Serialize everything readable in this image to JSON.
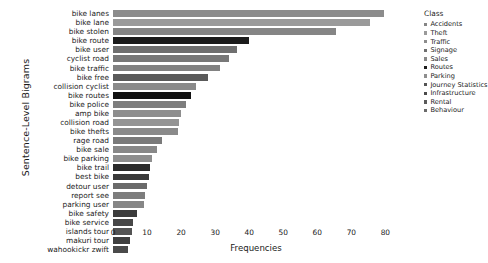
{
  "chart_data": {
    "type": "bar",
    "orientation": "horizontal",
    "title": "",
    "xlabel": "Frequencies",
    "ylabel": "Sentence-Level Bigrams",
    "xlim": [
      0,
      84
    ],
    "xticks": [
      0,
      10,
      20,
      30,
      40,
      50,
      60,
      70,
      80
    ],
    "grid": false,
    "legend_position": "right",
    "categories": [
      "bike lanes",
      "bike lane",
      "bike stolen",
      "bike route",
      "bike user",
      "cyclist road",
      "bike traffic",
      "bike free",
      "collision cyclist",
      "bike routes",
      "bike police",
      "amp bike",
      "collision road",
      "bike thefts",
      "rage road",
      "bike sale",
      "bike parking",
      "bike trail",
      "best bike",
      "detour user",
      "report see",
      "parking user",
      "bike safety",
      "bike service",
      "islands tour",
      "makuri tour",
      "wahookickr zwift"
    ],
    "values": [
      79.5,
      75.5,
      65.5,
      40.0,
      36.5,
      34.0,
      31.5,
      28.0,
      24.5,
      23.0,
      21.5,
      20.0,
      19.5,
      19.0,
      14.5,
      13.0,
      11.5,
      11.0,
      10.5,
      10.0,
      9.5,
      9.0,
      7.0,
      6.0,
      5.5,
      5.0,
      4.5
    ],
    "bar_classes": [
      "Traffic",
      "Theft",
      "Accidents",
      "Routes",
      "Behaviour",
      "Traffic",
      "Traffic",
      "Rental",
      "Accidents",
      "Routes",
      "Accidents",
      "Traffic",
      "Accidents",
      "Theft",
      "Behaviour",
      "Sales",
      "Parking",
      "Routes",
      "Sales",
      "Signage",
      "Signage",
      "Parking",
      "Behaviour",
      "Rental",
      "Journey Statistics",
      "Journey Statistics",
      "Infrastructure"
    ],
    "bar_colors": [
      "#8c8c8c",
      "#9a9a9a",
      "#858585",
      "#1c1c1c",
      "#6f6f6f",
      "#787878",
      "#828282",
      "#5a5a5a",
      "#8a8a8a",
      "#111111",
      "#7e7e7e",
      "#8e8e8e",
      "#949494",
      "#8a8a8a",
      "#7a7a7a",
      "#888888",
      "#8e8e8e",
      "#2b2b2b",
      "#3a3a3a",
      "#6a6a6a",
      "#7d7d7d",
      "#868686",
      "#3c3c3c",
      "#474747",
      "#545454",
      "#3f3f3f",
      "#4a4a4a"
    ]
  },
  "legend": {
    "title": "Class",
    "items": [
      {
        "label": "Accidents",
        "color": "#858585"
      },
      {
        "label": "Theft",
        "color": "#9a9a9a"
      },
      {
        "label": "Traffic",
        "color": "#8c8c8c"
      },
      {
        "label": "Signage",
        "color": "#6f6f6f"
      },
      {
        "label": "Sales",
        "color": "#888888"
      },
      {
        "label": "Routes",
        "color": "#1c1c1c"
      },
      {
        "label": "Parking",
        "color": "#8e8e8e"
      },
      {
        "label": "Journey Statistics",
        "color": "#545454"
      },
      {
        "label": "Infrastructure",
        "color": "#4a4a4a"
      },
      {
        "label": "Rental",
        "color": "#5a5a5a"
      },
      {
        "label": "Behaviour",
        "color": "#6a6a6a"
      }
    ]
  }
}
